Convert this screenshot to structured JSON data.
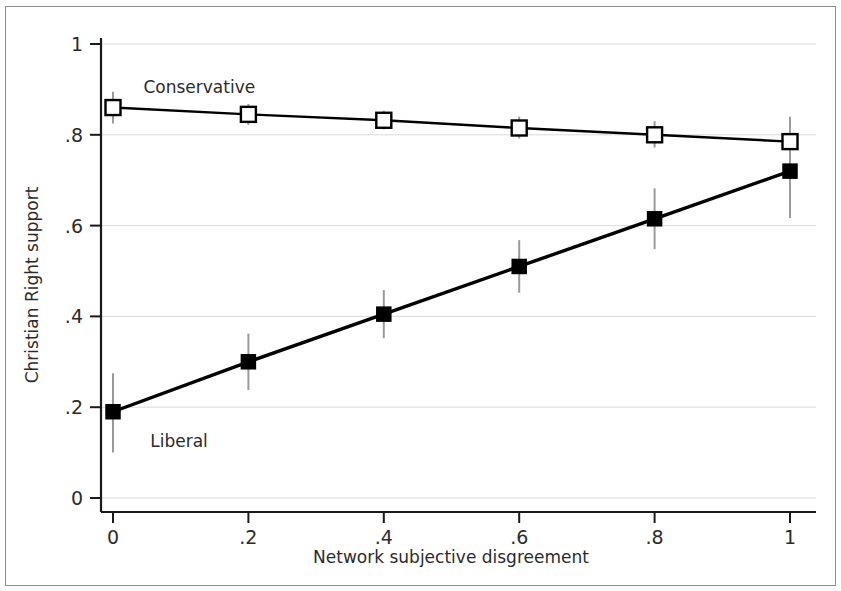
{
  "chart_data": {
    "type": "line",
    "title": "",
    "subtitle": "",
    "xlabel": "Network subjective disgreement",
    "ylabel": "Christian Right support",
    "xlim": [
      0,
      1
    ],
    "ylim": [
      0,
      1
    ],
    "x": [
      0,
      0.2,
      0.4,
      0.6,
      0.8,
      1
    ],
    "xtick_labels": [
      "0",
      ".2",
      ".4",
      ".6",
      ".8",
      "1"
    ],
    "ytick_values": [
      0,
      0.2,
      0.4,
      0.6,
      0.8,
      1
    ],
    "ytick_labels": [
      "0",
      ".2",
      ".4",
      ".6",
      ".8",
      "1"
    ],
    "grid": "horizontal",
    "grid_color": "#d9d9d9",
    "legend_position": "inline-annotation",
    "series": [
      {
        "name": "Conservative",
        "marker": "open-square",
        "color": "#000000",
        "values": [
          0.86,
          0.845,
          0.832,
          0.815,
          0.8,
          0.785
        ],
        "error_low": [
          0.825,
          0.822,
          0.812,
          0.792,
          0.772,
          0.732
        ],
        "error_high": [
          0.895,
          0.868,
          0.853,
          0.84,
          0.83,
          0.84
        ],
        "label_x": 0.045,
        "label_y": 0.905
      },
      {
        "name": "Liberal",
        "marker": "filled-square",
        "color": "#000000",
        "values": [
          0.19,
          0.3,
          0.405,
          0.51,
          0.615,
          0.72
        ],
        "error_low": [
          0.1,
          0.238,
          0.352,
          0.452,
          0.548,
          0.617
        ],
        "error_high": [
          0.275,
          0.362,
          0.458,
          0.568,
          0.682,
          0.822
        ],
        "label_x": 0.055,
        "label_y": 0.125
      }
    ]
  },
  "figure": {
    "border_color": "#8d8d8d",
    "background": "#ffffff"
  }
}
